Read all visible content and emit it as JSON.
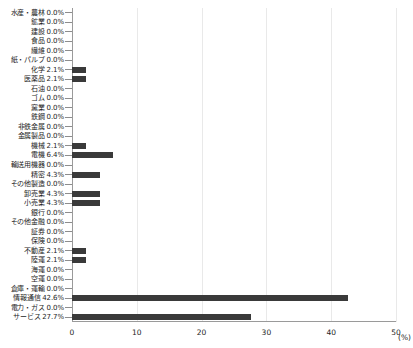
{
  "chart_data": {
    "type": "bar",
    "orientation": "horizontal",
    "title": "",
    "xlabel": "(%)",
    "ylabel": "",
    "xlim": [
      0,
      50
    ],
    "xticks": [
      0,
      10,
      20,
      30,
      40,
      50
    ],
    "unit_label": "(%)",
    "grid": true,
    "legend": null,
    "bar_color": "#3a3a3a",
    "axis_color": "#9a9a9a",
    "grid_color": "#e9e9e9",
    "value_suffix": "%",
    "categories": [
      "水産・農林",
      "鉱業",
      "建設",
      "食品",
      "繊維",
      "紙・パルプ",
      "化学",
      "医薬品",
      "石油",
      "ゴム",
      "窯業",
      "鉄鋼",
      "非鉄金属",
      "金属製品",
      "機械",
      "電機",
      "輸送用機器",
      "精密",
      "その他製造",
      "卸売業",
      "小売業",
      "銀行",
      "その他金融",
      "証券",
      "保険",
      "不動産",
      "陸運",
      "海運",
      "空運",
      "倉庫・運輸",
      "情報通信",
      "電力・ガス",
      "サービス"
    ],
    "values": [
      0.0,
      0.0,
      0.0,
      0.0,
      0.0,
      0.0,
      2.1,
      2.1,
      0.0,
      0.0,
      0.0,
      0.0,
      0.0,
      0.0,
      2.1,
      6.4,
      0.0,
      4.3,
      0.0,
      4.3,
      4.3,
      0.0,
      0.0,
      0.0,
      0.0,
      2.1,
      2.1,
      0.0,
      0.0,
      0.0,
      42.6,
      0.0,
      27.7
    ],
    "value_labels": [
      "0.0%",
      "0.0%",
      "0.0%",
      "0.0%",
      "0.0%",
      "0.0%",
      "2.1%",
      "2.1%",
      "0.0%",
      "0.0%",
      "0.0%",
      "0.0%",
      "0.0%",
      "0.0%",
      "2.1%",
      "6.4%",
      "0.0%",
      "4.3%",
      "0.0%",
      "4.3%",
      "4.3%",
      "0.0%",
      "0.0%",
      "0.0%",
      "0.0%",
      "2.1%",
      "2.1%",
      "0.0%",
      "0.0%",
      "0.0%",
      "42.6%",
      "0.0%",
      "27.7%"
    ],
    "xtick_labels": [
      "0",
      "10",
      "20",
      "30",
      "40",
      "50"
    ]
  }
}
